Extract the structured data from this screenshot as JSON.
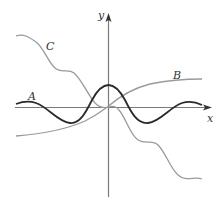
{
  "figure": {
    "axes": {
      "x_label": "x",
      "y_label": "y",
      "axis_color": "#7a7a7a"
    },
    "curves": [
      {
        "label": "A",
        "color": "#2a2a2a",
        "style": "dark, oscillating damped wave with peak at origin"
      },
      {
        "label": "B",
        "color": "#9a9a9a",
        "style": "gray, increasing S-shaped curve through origin"
      },
      {
        "label": "C",
        "color": "#9a9a9a",
        "style": "gray, decreasing wavy curve through origin"
      }
    ]
  },
  "labels": {
    "x": "x",
    "y": "y",
    "a": "A",
    "b": "B",
    "c": "C"
  }
}
